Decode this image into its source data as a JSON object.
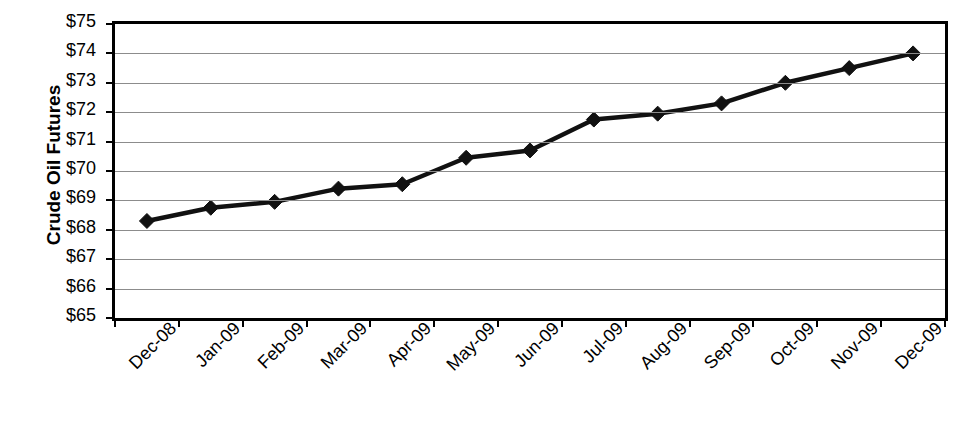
{
  "chart_data": {
    "type": "line",
    "title": "",
    "xlabel": "",
    "ylabel": "Crude Oil Futures",
    "ylim": [
      65,
      75
    ],
    "ytick_step": 1,
    "ytick_labels": [
      "$75",
      "$74",
      "$73",
      "$72",
      "$71",
      "$70",
      "$69",
      "$68",
      "$67",
      "$66",
      "$65"
    ],
    "ytick_values": [
      75,
      74,
      73,
      72,
      71,
      70,
      69,
      68,
      67,
      66,
      65
    ],
    "grid": true,
    "legend": "none",
    "categories": [
      "Dec-08",
      "Jan-09",
      "Feb-09",
      "Mar-09",
      "Apr-09",
      "May-09",
      "Jun-09",
      "Jul-09",
      "Aug-09",
      "Sep-09",
      "Oct-09",
      "Nov-09",
      "Dec-09"
    ],
    "series": [
      {
        "name": "Crude Oil Futures",
        "marker": "diamond",
        "color": "#111111",
        "values": [
          68.3,
          68.75,
          68.95,
          69.4,
          69.55,
          70.45,
          70.7,
          71.75,
          71.95,
          72.3,
          73.0,
          73.5,
          74.0
        ]
      }
    ],
    "value_labels": [
      "$68.30",
      "$68.75",
      "$68.95",
      "$69.40",
      "$69.55",
      "$70.45",
      "$70.70",
      "$71.75",
      "$71.95",
      "$72.30",
      "$73.00",
      "$73.50",
      "$74.00"
    ]
  },
  "caption": {
    "remnant": ""
  }
}
